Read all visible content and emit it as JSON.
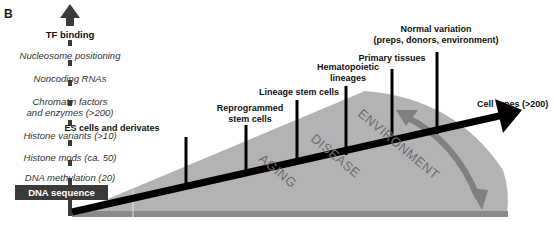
{
  "panel_label": "B",
  "left_stack": {
    "top_label": "TF binding",
    "items": [
      "Nucleosome positioning",
      "Noncoding RNAs",
      "Chromatin factors",
      "and enzymes (>200)",
      "Histone variants (>10)",
      "Histone mods (ca. 50)",
      "DNA methylation (20)"
    ],
    "base_label": "DNA sequence"
  },
  "axis": {
    "label": "Cell types (>200)"
  },
  "sticks": [
    {
      "line1": "ES cells and derivates",
      "line2": ""
    },
    {
      "line1": "Reprogrammed",
      "line2": "stem cells"
    },
    {
      "line1": "Lineage stem cells",
      "line2": ""
    },
    {
      "line1": "Hematopoietic",
      "line2": "lineages"
    },
    {
      "line1": "Primary tissues",
      "line2": ""
    },
    {
      "line1": "Normal variation",
      "line2": "(preps, donors, environment)"
    }
  ],
  "regions": [
    "AGING",
    "DISEASE",
    "ENVIRONMENT"
  ],
  "colors": {
    "region_fill": "#b3b3b3",
    "band": "#8a8a8a",
    "axis": "#000000",
    "region_text": "#6e6e6e",
    "curved_arrow": "#808080",
    "dna_box": "#3a3a3a"
  }
}
